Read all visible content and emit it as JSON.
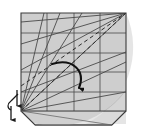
{
  "figure": {
    "title": "Origami folding step diagram",
    "canvas": {
      "width": 150,
      "height": 136
    },
    "colors": {
      "background": "#ffffff",
      "paper_fill": "#d9d9d9",
      "circle_fill": "#cfcfcf",
      "flap_fill": "#e4e4e4",
      "line": "#4a4a4a",
      "heavy_line": "#2b2b2b",
      "arrow": "#111111"
    }
  },
  "paper": {
    "label": "square sheet",
    "corners": {
      "top_left": [
        21,
        13
      ],
      "top_right": [
        126,
        13
      ],
      "bottom_right": [
        126,
        111
      ],
      "bottom_left": [
        21,
        111
      ]
    }
  },
  "flap": {
    "label": "folded bottom flap",
    "points": [
      [
        21,
        111
      ],
      [
        126,
        111
      ],
      [
        112,
        125
      ],
      [
        35,
        125
      ]
    ]
  },
  "shaded_circle": {
    "label": "shaded quarter circle",
    "center": [
      56,
      40
    ],
    "radius": 86
  },
  "grid": {
    "horizontal_lines_y": [
      33,
      53,
      72,
      92
    ],
    "vertical_lines_x": [
      47,
      74,
      100
    ],
    "note": "evenly spaced reference grid on the sheet"
  },
  "fan_bottom_left": {
    "label": "creases radiating from bottom-left corner",
    "origin": [
      21,
      111
    ],
    "endpoints": [
      [
        48,
        13
      ],
      [
        68,
        13
      ],
      [
        90,
        13
      ],
      [
        126,
        13
      ],
      [
        126,
        52
      ],
      [
        126,
        92
      ]
    ]
  },
  "fan_top_right": {
    "label": "creases radiating from top-right corner",
    "origin": [
      126,
      13
    ],
    "endpoints": [
      [
        21,
        13
      ],
      [
        21,
        44
      ],
      [
        21,
        70
      ],
      [
        21,
        111
      ]
    ]
  },
  "dashed_creases": [
    {
      "name": "valley-crease-upper",
      "from": [
        21,
        111
      ],
      "to": [
        126,
        13
      ],
      "style": "dashed"
    },
    {
      "name": "valley-crease-lower",
      "from": [
        21,
        88
      ],
      "to": [
        126,
        13
      ],
      "style": "dashed"
    }
  ],
  "fold_arrow": {
    "label": "fold-here curved arrow",
    "start": [
      52,
      64
    ],
    "control": [
      83,
      66
    ],
    "end": [
      80,
      94
    ],
    "head": "solid triangle pointing down"
  },
  "repeat_symbol": {
    "label": "repeat and turn over symbol",
    "arrow_down": {
      "from": [
        16,
        90
      ],
      "to": [
        16,
        110
      ]
    },
    "arrow_up": {
      "from": [
        11,
        118
      ],
      "to": [
        11,
        98
      ]
    },
    "tick": "diagonal slash marking repeat count",
    "position": [
      8,
      88
    ]
  },
  "legend": {
    "solid": "mountain / edge",
    "dashed": "valley crease"
  }
}
